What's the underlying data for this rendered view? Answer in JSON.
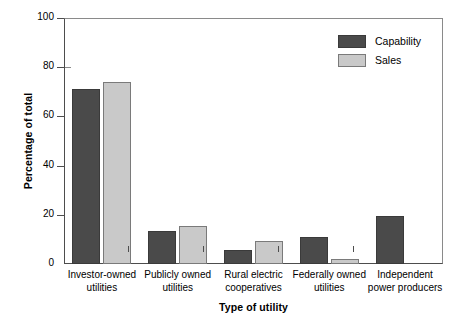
{
  "chart_data": {
    "type": "bar",
    "title": "",
    "xlabel": "Type of utility",
    "ylabel": "Percentage of total",
    "ylim": [
      0,
      100
    ],
    "yticks": [
      0,
      20,
      40,
      60,
      80,
      100
    ],
    "grid": false,
    "legend_position": "top-right",
    "categories": [
      "Investor-owned\nutilities",
      "Publicly owned\nutilities",
      "Rural electric\ncooperatives",
      "Federally owned\nutilities",
      "Independent\npower producers"
    ],
    "series": [
      {
        "name": "Capability",
        "color": "#4a4a4a",
        "values": [
          71,
          13.5,
          5.5,
          11,
          19.5
        ]
      },
      {
        "name": "Sales",
        "color": "#c9c9c9",
        "values": [
          74,
          15.5,
          9.5,
          2,
          0
        ]
      }
    ]
  },
  "axis": {
    "y_title": "Percentage of total",
    "x_title": "Type of utility",
    "y_tick_labels": [
      "0",
      "20",
      "40",
      "60",
      "80",
      "100"
    ]
  },
  "legend": {
    "items": [
      {
        "label": "Capability",
        "color": "#4a4a4a"
      },
      {
        "label": "Sales",
        "color": "#c9c9c9"
      }
    ]
  },
  "categories": [
    {
      "line1": "Investor-owned",
      "line2": "utilities"
    },
    {
      "line1": "Publicly owned",
      "line2": "utilities"
    },
    {
      "line1": "Rural electric",
      "line2": "cooperatives"
    },
    {
      "line1": "Federally owned",
      "line2": "utilities"
    },
    {
      "line1": "Independent",
      "line2": "power producers"
    }
  ]
}
